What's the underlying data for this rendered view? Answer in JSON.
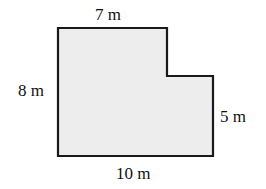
{
  "diagram": {
    "type": "L-shaped polygon (composite rectangle)",
    "fill_color": "#ededed",
    "stroke_color": "#1a1a1a",
    "labels": {
      "top": "7 m",
      "left": "8 m",
      "right": "5 m",
      "bottom": "10 m"
    },
    "dimensions": {
      "top_width_m": 7,
      "left_height_m": 8,
      "right_height_m": 5,
      "bottom_width_m": 10
    }
  }
}
